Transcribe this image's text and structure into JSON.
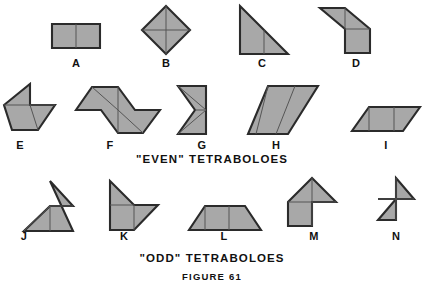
{
  "figure": {
    "caption": "FIGURE 61",
    "background_color": "#ffffff",
    "piece_fill_color": "#a8a8a8",
    "piece_outline_color": "#2b2b2b",
    "seam_color": "#555555",
    "text_color": "#111111"
  },
  "sections": [
    {
      "id": "even",
      "caption": "\"EVEN\"  TETRABOLOES"
    },
    {
      "id": "odd",
      "caption": "\"ODD\"  TETRABOLOES"
    }
  ],
  "shapes": [
    {
      "label": "A",
      "section": "even",
      "label_x": 76,
      "label_y": 66,
      "outline": "52,24 100,24 100,48 52,48",
      "seams": [
        "76,24 76,48"
      ]
    },
    {
      "label": "B",
      "section": "even",
      "label_x": 166,
      "label_y": 66,
      "outline": "166,6 190,30 166,54 142,30",
      "seams": [
        "166,6 166,54",
        "142,30 190,30"
      ]
    },
    {
      "label": "C",
      "section": "even",
      "label_x": 262,
      "label_y": 66,
      "outline": "240,6 288,54 240,54",
      "seams": [
        "264,30 264,54"
      ]
    },
    {
      "label": "D",
      "section": "even",
      "label_x": 356,
      "label_y": 66,
      "outline": "320,8 345,8 370,29 370,53 345,53 345,29",
      "seams": [
        "345,8 345,29",
        "345,29 370,29"
      ]
    },
    {
      "label": "E",
      "section": "even",
      "label_x": 20,
      "label_y": 148,
      "outline": "30,84 30,105 55,105 38,130 12,130 4,105",
      "seams": [
        "4,105 30,105",
        "30,105 38,130",
        "30,105 30,130"
      ]
    },
    {
      "label": "F",
      "section": "even",
      "label_x": 110,
      "label_y": 148,
      "outline": "92,87 118,87 135,110 160,110 143,133 118,133 101,110 76,110",
      "seams": [
        "92,87 118,110",
        "118,87 118,133",
        "118,110 143,133"
      ]
    },
    {
      "label": "G",
      "section": "even",
      "label_x": 202,
      "label_y": 148,
      "outline": "178,86 205,86 205,110 178,110 196,110 178,134 205,134 205,110",
      "seams": [
        "178,86 205,110",
        "178,134 205,110",
        "178,110 205,110"
      ]
    },
    {
      "label": "H",
      "section": "even",
      "label_x": 276,
      "label_y": 148,
      "outline": "268,86 318,86 288,134 248,134",
      "seams": [
        "268,86 248,134",
        "288,86 268,134"
      ]
    },
    {
      "label": "I",
      "section": "even",
      "label_x": 386,
      "label_y": 148,
      "outline": "369,107 420,107 403,131 352,131",
      "seams": [
        "369,107 369,131",
        "394,107 394,131"
      ]
    },
    {
      "label": "J",
      "section": "odd",
      "label_x": 24,
      "label_y": 240,
      "outline": "50,181 72,206 72,181 50,206 24,231 72,231 50,206",
      "seams": [
        "24,231 50,206",
        "50,206 72,206",
        "50,181 50,206"
      ]
    },
    {
      "label": "K",
      "section": "odd",
      "label_x": 124,
      "label_y": 240,
      "outline": "110,181 134,206 134,206 158,206 134,230 110,230",
      "seams": [
        "110,206 134,206",
        "134,206 134,230",
        "110,181 134,206"
      ]
    },
    {
      "label": "L",
      "section": "odd",
      "label_x": 224,
      "label_y": 240,
      "outline": "205,206 245,206 261,230 189,230",
      "seams": [
        "205,206 205,230",
        "229,206 229,230"
      ]
    },
    {
      "label": "M",
      "section": "odd",
      "label_x": 314,
      "label_y": 240,
      "outline": "312,178 336,202 312,202 312,226 288,226 288,202 288,202",
      "seams": [
        "288,202 336,202",
        "312,178 312,226"
      ]
    },
    {
      "label": "N",
      "section": "odd",
      "label_x": 396,
      "label_y": 240,
      "outline": "396,178 414,199 396,199 378,199 396,199 396,220 378,220 396,199",
      "seams": [
        "378,199 414,199",
        "396,178 396,220"
      ]
    }
  ],
  "captions": {
    "even_x": 212,
    "even_y": 163,
    "odd_x": 212,
    "odd_y": 262,
    "figure_x": 212,
    "figure_y": 280
  }
}
